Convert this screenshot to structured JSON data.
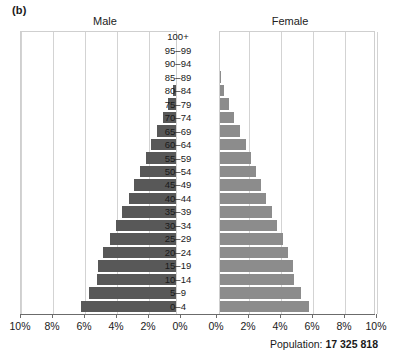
{
  "panel": {
    "label": "(b)"
  },
  "headers": {
    "male": "Male",
    "female": "Female"
  },
  "footer": {
    "population_prefix": "Population:",
    "population_value": "17 325 818"
  },
  "axis": {
    "ticks": [
      "10%",
      "8%",
      "6%",
      "4%",
      "2%",
      "0%",
      "0%",
      "2%",
      "4%",
      "6%",
      "8%",
      "10%"
    ],
    "max_percent": 10,
    "step_percent": 2
  },
  "colors": {
    "male_bar": "#585858",
    "female_bar": "#8c8c8c",
    "gridline": "#d3d3d3",
    "axis": "#6b6b6b",
    "background": "#ffffff"
  },
  "chart_data": {
    "type": "bar",
    "subtype": "population-pyramid",
    "title": "",
    "xlabel": "",
    "ylabel": "",
    "xlim": [
      -10,
      10
    ],
    "grid": true,
    "legend_position": "top",
    "categories": [
      "100+",
      "95–99",
      "90–94",
      "85–89",
      "80–84",
      "75–79",
      "70–74",
      "65–69",
      "60–64",
      "55–59",
      "50–54",
      "45–49",
      "40–44",
      "35–39",
      "30–34",
      "25–29",
      "20–24",
      "15–19",
      "10–14",
      "5–9",
      "0–4"
    ],
    "series": [
      {
        "name": "Male",
        "units": "percent of total population",
        "values": [
          0.02,
          0.05,
          0.12,
          0.25,
          0.45,
          0.75,
          1.05,
          1.45,
          1.8,
          2.15,
          2.5,
          2.85,
          3.2,
          3.6,
          4.0,
          4.4,
          4.8,
          5.1,
          5.2,
          5.7,
          6.2
        ]
      },
      {
        "name": "Female",
        "units": "percent of total population",
        "values": [
          0.02,
          0.06,
          0.15,
          0.3,
          0.5,
          0.8,
          1.1,
          1.5,
          1.85,
          2.2,
          2.5,
          2.8,
          3.1,
          3.5,
          3.8,
          4.2,
          4.5,
          4.8,
          4.9,
          5.3,
          5.8
        ]
      }
    ],
    "total_population": "17 325 818"
  }
}
